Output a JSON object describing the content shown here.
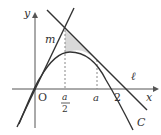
{
  "diagram": {
    "axes": {
      "x_label": "x",
      "y_label": "y",
      "origin_label": "O"
    },
    "curve_label": "C",
    "tangent_labels": {
      "left": "m",
      "right": "ℓ"
    },
    "x_ticks": [
      {
        "num": "a",
        "den": "2"
      },
      {
        "label": "a"
      },
      {
        "label": "2"
      }
    ],
    "colors": {
      "stroke": "#333333",
      "shade": "#d9d9d9",
      "dashed": "#888888"
    }
  }
}
